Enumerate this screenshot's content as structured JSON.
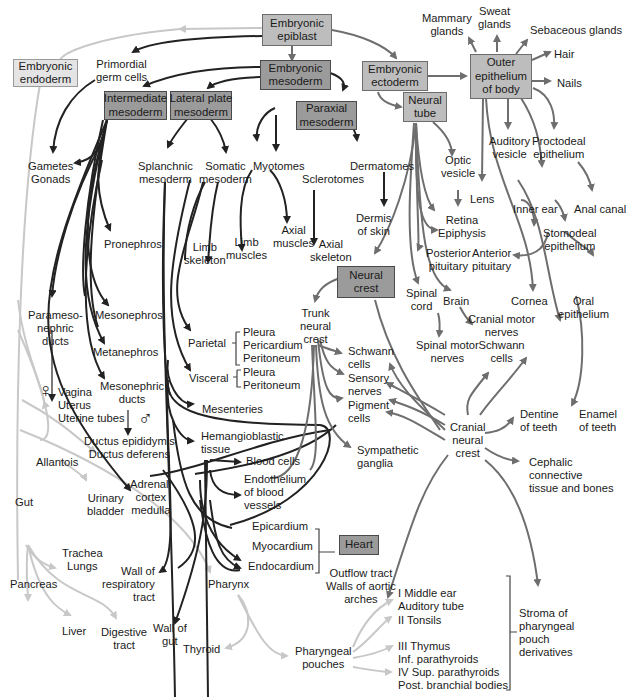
{
  "colors": {
    "endoderm_line": "#c8c8c8",
    "mesoderm_line": "#222222",
    "ectoderm_line": "#6e6e6e",
    "box_light": "#e4e4e4",
    "box_mid": "#bdbdbd",
    "box_dark": "#9b9b9b"
  },
  "boxes": {
    "epiblast": "Embryonic\nepiblast",
    "endoderm": "Embryonic\nendoderm",
    "mesoderm": "Embryonic\nmesoderm",
    "ectoderm": "Embryonic\nectoderm",
    "intermediate": "Intermediate\nmesoderm",
    "lateral": "Lateral plate\nmesoderm",
    "paraxial": "Paraxial\nmesoderm",
    "neural_tube": "Neural\ntube",
    "outer_epithelium": "Outer\nepithelium\nof body",
    "neural_crest": "Neural\ncrest",
    "heart": "Heart"
  },
  "labels": {
    "primordial_germ": "Primordial\ngerm cells",
    "gametes": "Gametes\nGonads",
    "splanchnic": "Splanchnic\nmesoderm",
    "somatic": "Somatic\nmesoderm",
    "myotomes": "Myotomes",
    "sclerotomes": "Sclerotomes",
    "dermatomes": "Dermatomes",
    "pronephros": "Pronephros",
    "limb_skeleton": "Limb\nskeleton",
    "limb_muscles": "Limb\nmuscles",
    "axial_muscles": "Axial\nmuscles",
    "axial_skeleton": "Axial\nskeleton",
    "dermis": "Dermis\nof skin",
    "paramesonephric": "Parameso-\nnephric\nducts",
    "mesonephros": "Mesonephros",
    "metanephros": "Metanephros",
    "parietal": "Parietal",
    "parietal_list": "Pleura\nPericardium\nPeritoneum",
    "visceral": "Visceral",
    "visceral_list": "Pleura\nPeritoneum",
    "female_list": "Vagina\nUterus\nUterine tubes",
    "mesonephric": "Mesonephric\nducts",
    "ductus": "Ductus epididymis\nDuctus deferens",
    "mesenteries": "Mesenteries",
    "hemangioblastic": "Hemangioblastic\ntissue",
    "blood_cells": "Blood cells",
    "endothelium": "Endothelium\nof blood\nvessels",
    "allantois": "Allantois",
    "urinary_bladder": "Urinary\nbladder",
    "adrenal": "Adrenal:\ncortex\nmedulla",
    "gut": "Gut",
    "epicardium": "Epicardium",
    "myocardium": "Myocardium",
    "endocardium": "Endocardium",
    "trachea": "Trachea\nLungs",
    "pancreas": "Pancreas",
    "wall_resp": "Wall of\nrespiratory\ntract",
    "pharynx": "Pharynx",
    "liver": "Liver",
    "digestive": "Digestive\ntract",
    "wall_gut": "Wall of\ngut",
    "thyroid": "Thyroid",
    "pharyngeal_pouches": "Pharyngeal\npouches",
    "outflow": "Outflow tract\nWalls of aortic\narches",
    "pouch_1": "I Middle ear\nAuditory tube",
    "pouch_2": "II Tonsils",
    "pouch_3": "III Thymus\nInf. parathyroids",
    "pouch_4": "IV Sup. parathyroids\nPost. branchial bodies",
    "stroma": "Stroma of\npharyngeal\npouch\nderivatives",
    "mammary": "Mammary\nglands",
    "sweat": "Sweat\nglands",
    "sebaceous": "Sebaceous glands",
    "hair": "Hair",
    "nails": "Nails",
    "optic_vesicle": "Optic\nvesicle",
    "auditory_vesicle": "Auditory\nvesicle",
    "proctodeal": "Proctodeal\nepithelium",
    "lens": "Lens",
    "inner_ear": "Inner ear",
    "anal_canal": "Anal canal",
    "retina": "Retina\nEpiphysis",
    "posterior_pit": "Posterior\npituitary",
    "anterior_pit": "Anterior\npituitary",
    "stomodeal": "Stomodeal\nepithelium",
    "spinal_cord": "Spinal\ncord",
    "brain": "Brain",
    "cornea": "Cornea",
    "oral_epi": "Oral\nepithelium",
    "trunk_crest": "Trunk\nneural\ncrest",
    "cranial_motor": "Cranial motor\nnerves\nSchwann\ncells",
    "spinal_motor": "Spinal motor\nnerves",
    "schwann": "Schwann\ncells",
    "sensory": "Sensory\nnerves",
    "pigment": "Pigment\ncells",
    "sympathetic": "Sympathetic\nganglia",
    "cranial_crest": "Cranial\nneural\ncrest",
    "dentine": "Dentine\nof teeth",
    "enamel": "Enamel\nof teeth",
    "cephalic": "Cephalic\nconnective\ntissue and bones"
  },
  "symbols": {
    "female": "♀",
    "male": "♂"
  }
}
